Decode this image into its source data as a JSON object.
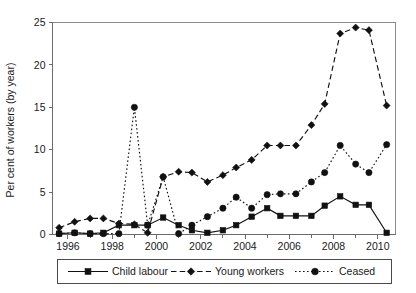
{
  "chart_data": {
    "type": "line",
    "title": "",
    "xlabel": "",
    "ylabel": "Per cent of workers (by year)",
    "xlim": [
      1995.3,
      2010.8
    ],
    "ylim": [
      0,
      25
    ],
    "yticks": [
      0,
      5,
      10,
      15,
      20,
      25
    ],
    "ytick_labels": [
      "0",
      "5",
      "10",
      "15",
      "20",
      "25"
    ],
    "xticks": [
      1996,
      1998,
      2000,
      2002,
      2004,
      2006,
      2008,
      2010
    ],
    "xtick_labels": [
      "1996",
      "1998",
      "2000",
      "2002",
      "2004",
      "2006",
      "2008",
      "2010"
    ],
    "x_minor_ticks": [
      1997,
      1999,
      2001,
      2003,
      2005,
      2007,
      2009
    ],
    "grid": false,
    "legend_position": "below-center",
    "x": [
      1995.6,
      1996.3,
      1997.0,
      1997.6,
      1998.3,
      1999.0,
      1999.6,
      2000.3,
      2001.0,
      2001.6,
      2002.3,
      2003.0,
      2003.6,
      2004.3,
      2005.0,
      2005.6,
      2006.3,
      2007.0,
      2007.6,
      2008.3,
      2009.0,
      2009.6,
      2010.4
    ],
    "series": [
      {
        "name": "Child labour",
        "marker": "square",
        "linestyle": "solid",
        "values": [
          0.1,
          0.2,
          0.1,
          0.2,
          1.1,
          1.1,
          1.1,
          2.0,
          1.1,
          0.5,
          0.2,
          0.5,
          1.1,
          2.1,
          3.1,
          2.2,
          2.2,
          2.2,
          3.4,
          4.5,
          3.5,
          3.5,
          0.2
        ]
      },
      {
        "name": "Young workers",
        "marker": "diamond",
        "linestyle": "dashed",
        "values": [
          0.8,
          1.5,
          1.9,
          1.9,
          1.3,
          1.2,
          0.2,
          6.8,
          7.4,
          7.3,
          6.2,
          7.0,
          7.9,
          8.8,
          10.5,
          10.5,
          10.5,
          12.9,
          15.4,
          23.7,
          24.4,
          24.1,
          15.2
        ]
      },
      {
        "name": "Ceased",
        "marker": "circle",
        "linestyle": "dotted",
        "values": [
          0.1,
          0.2,
          0.1,
          0.1,
          0.1,
          15.0,
          1.1,
          6.8,
          0.1,
          1.1,
          2.1,
          3.1,
          4.4,
          3.1,
          4.7,
          4.8,
          4.8,
          6.2,
          7.3,
          10.5,
          8.3,
          7.3,
          10.6
        ]
      }
    ],
    "legend_entries": [
      {
        "label": "Child labour",
        "marker": "square",
        "linestyle": "solid"
      },
      {
        "label": "Young workers",
        "marker": "diamond",
        "linestyle": "dashed"
      },
      {
        "label": "Ceased",
        "marker": "circle",
        "linestyle": "dotted"
      }
    ]
  },
  "colors": {
    "ink": "#111111",
    "axis": "#6b6b6b",
    "frame": "#8a8a8a",
    "background": "#ffffff"
  }
}
